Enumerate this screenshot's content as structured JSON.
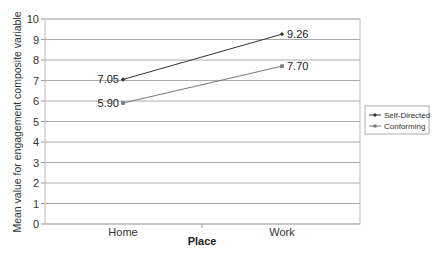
{
  "chart_data": {
    "type": "line",
    "title": "",
    "xlabel": "Place",
    "ylabel": "Mean value for engagement composite variable",
    "categories": [
      "Home",
      "Work"
    ],
    "series": [
      {
        "name": "Self-Directed",
        "values": [
          7.05,
          9.26
        ],
        "labels": [
          "7.05",
          "9.26"
        ],
        "color": "#333333",
        "marker": "diamond"
      },
      {
        "name": "Conforming",
        "values": [
          5.9,
          7.7
        ],
        "labels": [
          "5.90",
          "7.70"
        ],
        "color": "#777777",
        "marker": "square"
      }
    ],
    "ylim": [
      0,
      10
    ],
    "yticks": [
      "0",
      "1",
      "2",
      "3",
      "4",
      "5",
      "6",
      "7",
      "8",
      "9",
      "10"
    ],
    "grid": true,
    "legend_position": "right"
  }
}
